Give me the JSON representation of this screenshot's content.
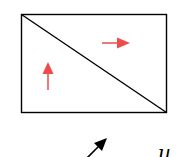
{
  "diagram": {
    "rectangle": {
      "x": 21,
      "y": 14,
      "width": 146,
      "height": 99,
      "stroke": "#000000"
    },
    "diagonal": {
      "x1": 21,
      "y1": 14,
      "x2": 167,
      "y2": 113,
      "stroke": "#000000"
    },
    "arrows": [
      {
        "name": "right-arrow",
        "direction": "right",
        "color": "#f04a4a"
      },
      {
        "name": "up-arrow",
        "direction": "up",
        "color": "#f04a4a"
      },
      {
        "name": "diagonal-arrow",
        "direction": "up-right",
        "color": "#000000"
      }
    ],
    "label": "u"
  }
}
